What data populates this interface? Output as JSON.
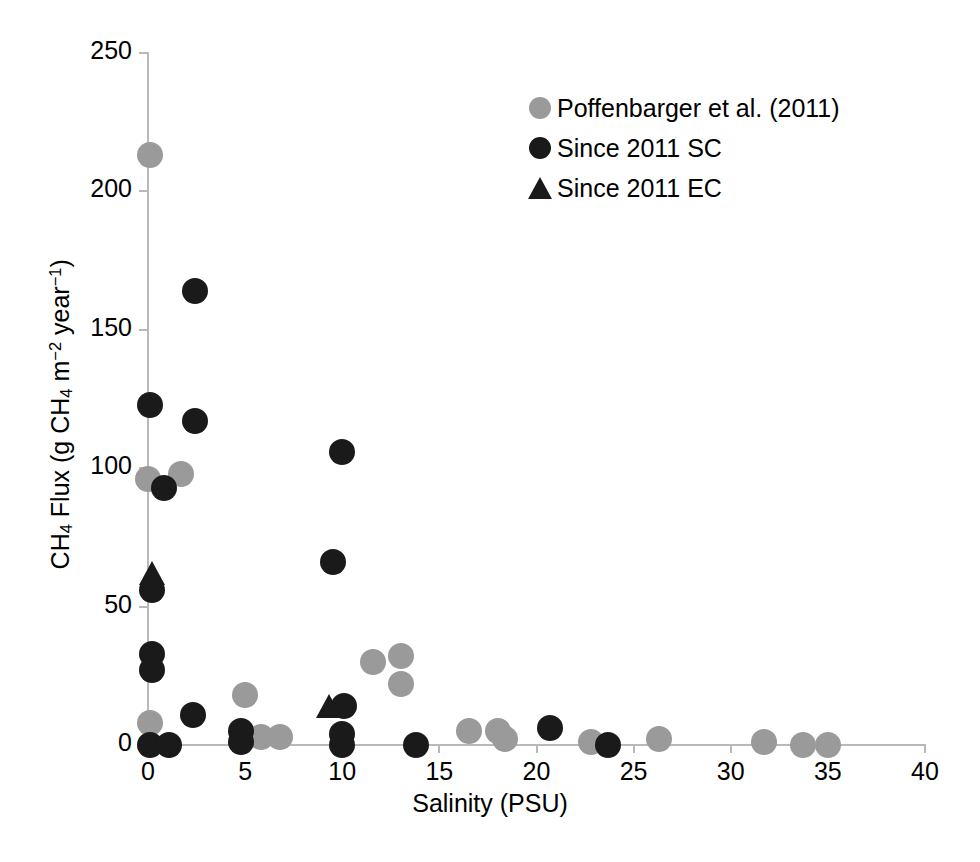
{
  "chart_data": {
    "type": "scatter",
    "title": "",
    "xlabel": "Salinity (PSU)",
    "ylabel": "CH4 Flux (g CH4 m-2 year-1)",
    "ylabel_parts": {
      "prefix": "CH",
      "sub1": "4",
      "mid": " Flux (g CH",
      "sub2": "4",
      "mid2": " m",
      "sup1": "−2",
      "mid3": " year",
      "sup2": "−1",
      "suffix": ")"
    },
    "xlim": [
      0,
      40
    ],
    "ylim": [
      0,
      250
    ],
    "xticks": [
      0,
      5,
      10,
      15,
      20,
      25,
      30,
      35,
      40
    ],
    "yticks": [
      0,
      50,
      100,
      150,
      200,
      250
    ],
    "xtick_labels": [
      "0",
      "5",
      "10",
      "15",
      "20",
      "25",
      "30",
      "35",
      "40"
    ],
    "ytick_labels": [
      "0",
      "50",
      "100",
      "150",
      "200",
      "250"
    ],
    "grid": false,
    "legend_position": "top-right",
    "colors": {
      "gray_marker": "#9a9a9a",
      "black_marker": "#1a1a1a",
      "axis": "#b9b9b9",
      "text": "#000000",
      "background": "#ffffff"
    },
    "series": [
      {
        "name": "Poffenbarger et al. (2011)",
        "marker": "circle",
        "color": "#9a9a9a",
        "points": [
          {
            "x": 0.1,
            "y": 213
          },
          {
            "x": 0.0,
            "y": 96
          },
          {
            "x": 1.7,
            "y": 98
          },
          {
            "x": 0.1,
            "y": 8
          },
          {
            "x": 5.0,
            "y": 18
          },
          {
            "x": 5.8,
            "y": 3
          },
          {
            "x": 6.8,
            "y": 3
          },
          {
            "x": 11.6,
            "y": 30
          },
          {
            "x": 13.0,
            "y": 32
          },
          {
            "x": 13.0,
            "y": 22
          },
          {
            "x": 16.5,
            "y": 5
          },
          {
            "x": 18.0,
            "y": 5
          },
          {
            "x": 18.4,
            "y": 2
          },
          {
            "x": 22.8,
            "y": 1
          },
          {
            "x": 26.3,
            "y": 2
          },
          {
            "x": 31.7,
            "y": 1
          },
          {
            "x": 33.7,
            "y": 0
          },
          {
            "x": 35.0,
            "y": 0
          }
        ]
      },
      {
        "name": "Since 2011 SC",
        "marker": "circle",
        "color": "#1a1a1a",
        "points": [
          {
            "x": 2.4,
            "y": 164
          },
          {
            "x": 0.1,
            "y": 123
          },
          {
            "x": 2.4,
            "y": 117
          },
          {
            "x": 10.0,
            "y": 106
          },
          {
            "x": 0.8,
            "y": 93
          },
          {
            "x": 9.5,
            "y": 66
          },
          {
            "x": 0.2,
            "y": 56
          },
          {
            "x": 0.2,
            "y": 33
          },
          {
            "x": 0.2,
            "y": 27
          },
          {
            "x": 2.3,
            "y": 11
          },
          {
            "x": 10.1,
            "y": 14
          },
          {
            "x": 4.8,
            "y": 5
          },
          {
            "x": 4.8,
            "y": 1
          },
          {
            "x": 10.0,
            "y": 4
          },
          {
            "x": 10.0,
            "y": 0
          },
          {
            "x": 0.1,
            "y": 0
          },
          {
            "x": 1.1,
            "y": 0
          },
          {
            "x": 13.8,
            "y": 0
          },
          {
            "x": 20.7,
            "y": 6
          },
          {
            "x": 23.7,
            "y": 0
          }
        ]
      },
      {
        "name": "Since 2011 EC",
        "marker": "triangle",
        "color": "#1a1a1a",
        "points": [
          {
            "x": 0.2,
            "y": 62
          },
          {
            "x": 9.3,
            "y": 14
          }
        ]
      }
    ]
  },
  "legend": {
    "items": [
      {
        "label": "Poffenbarger et al. (2011)",
        "marker": "circle",
        "color": "#9a9a9a"
      },
      {
        "label": "Since 2011 SC",
        "marker": "circle",
        "color": "#1a1a1a"
      },
      {
        "label": "Since 2011 EC",
        "marker": "triangle",
        "color": "#1a1a1a"
      }
    ]
  }
}
